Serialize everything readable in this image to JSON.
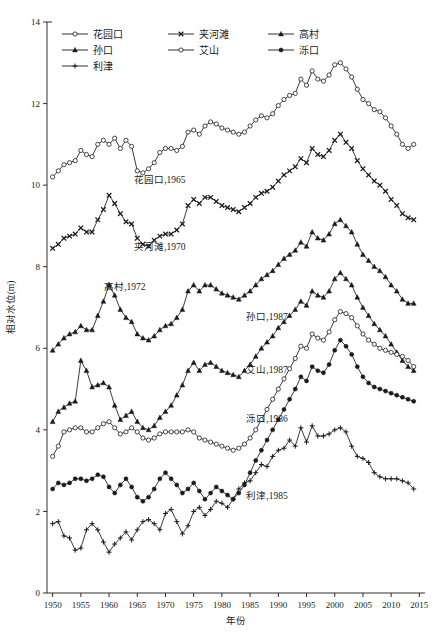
{
  "figure": {
    "width": 446,
    "height": 638,
    "background": "#ffffff",
    "line_color": "#1a1a1a"
  },
  "axes": {
    "x_title": "年份",
    "y_title": "相对水位(m)",
    "x_ticks": [
      "1950",
      "1955",
      "1960",
      "1965",
      "1970",
      "1975",
      "1980",
      "1985",
      "1990",
      "1995",
      "2000",
      "2005",
      "2010",
      "2015"
    ],
    "y_ticks": [
      "0",
      "2",
      "4",
      "6",
      "8",
      "10",
      "12",
      "14"
    ]
  },
  "legend": {
    "items": [
      {
        "label": "花园口",
        "marker": "open-circle"
      },
      {
        "label": "夹河滩",
        "marker": "x-cross"
      },
      {
        "label": "高村",
        "marker": "filled-triangle"
      },
      {
        "label": "孙口",
        "marker": "filled-triangle"
      },
      {
        "label": "艾山",
        "marker": "open-circle"
      },
      {
        "label": "泺口",
        "marker": "filled-circle"
      },
      {
        "label": "利津",
        "marker": "plus"
      }
    ]
  },
  "annotations": [
    {
      "text": "花园口,1965",
      "x": 1969.0,
      "y": 10.05
    },
    {
      "text": "夹河滩,1970",
      "x": 1969.0,
      "y": 8.42
    },
    {
      "text": "高村,1972",
      "x": 1962.8,
      "y": 7.42
    },
    {
      "text": "孙口,1987",
      "x": 1988.0,
      "y": 6.7
    },
    {
      "text": "艾山,1987",
      "x": 1988.0,
      "y": 5.4
    },
    {
      "text": "泺口,1986",
      "x": 1988.0,
      "y": 4.2
    },
    {
      "text": "利津,1985",
      "x": 1988.0,
      "y": 2.3
    }
  ],
  "chart_data": {
    "type": "line",
    "title": "",
    "subtitle": "",
    "xlabel": "年份",
    "ylabel": "相对水位(m)",
    "xlim": [
      1949,
      2016
    ],
    "ylim": [
      0,
      14
    ],
    "xticks": [
      1950,
      1955,
      1960,
      1965,
      1970,
      1975,
      1980,
      1985,
      1990,
      1995,
      2000,
      2005,
      2010,
      2015
    ],
    "yticks": [
      0,
      2,
      4,
      6,
      8,
      10,
      12,
      14
    ],
    "grid": false,
    "legend_position": "top-left-inside",
    "x": [
      1950,
      1951,
      1952,
      1953,
      1954,
      1955,
      1956,
      1957,
      1958,
      1959,
      1960,
      1961,
      1962,
      1963,
      1964,
      1965,
      1966,
      1967,
      1968,
      1969,
      1970,
      1971,
      1972,
      1973,
      1974,
      1975,
      1976,
      1977,
      1978,
      1979,
      1980,
      1981,
      1982,
      1983,
      1984,
      1985,
      1986,
      1987,
      1988,
      1989,
      1990,
      1991,
      1992,
      1993,
      1994,
      1995,
      1996,
      1997,
      1998,
      1999,
      2000,
      2001,
      2002,
      2003,
      2004,
      2005,
      2006,
      2007,
      2008,
      2009,
      2010,
      2011,
      2012,
      2013,
      2014
    ],
    "series": [
      {
        "name": "花园口",
        "marker": "open-circle",
        "annotation": "花园口,1965",
        "values": [
          10.2,
          10.35,
          10.5,
          10.55,
          10.6,
          10.85,
          10.75,
          10.7,
          11.0,
          11.1,
          11.0,
          11.15,
          10.9,
          11.1,
          10.95,
          10.35,
          10.3,
          10.4,
          10.55,
          10.8,
          10.9,
          10.9,
          10.85,
          10.95,
          11.3,
          11.35,
          11.25,
          11.45,
          11.55,
          11.5,
          11.4,
          11.35,
          11.3,
          11.25,
          11.3,
          11.45,
          11.6,
          11.7,
          11.65,
          11.75,
          11.95,
          12.1,
          12.2,
          12.25,
          12.6,
          12.45,
          12.8,
          12.6,
          12.55,
          12.7,
          12.95,
          13.0,
          12.85,
          12.65,
          12.35,
          12.1,
          12.0,
          11.85,
          11.8,
          11.65,
          11.45,
          11.25,
          11.0,
          10.9,
          11.0
        ]
      },
      {
        "name": "夹河滩",
        "marker": "x-cross",
        "annotation": "夹河滩,1970",
        "values": [
          8.45,
          8.55,
          8.7,
          8.75,
          8.8,
          8.95,
          8.85,
          8.85,
          9.15,
          9.4,
          9.75,
          9.55,
          9.3,
          9.1,
          9.05,
          8.7,
          8.55,
          8.5,
          8.65,
          8.75,
          8.8,
          8.8,
          8.9,
          9.05,
          9.5,
          9.65,
          9.55,
          9.7,
          9.7,
          9.6,
          9.5,
          9.45,
          9.4,
          9.35,
          9.45,
          9.55,
          9.7,
          9.8,
          9.85,
          9.95,
          10.1,
          10.25,
          10.35,
          10.45,
          10.65,
          10.55,
          10.9,
          10.75,
          10.7,
          10.85,
          11.1,
          11.25,
          11.05,
          10.9,
          10.6,
          10.4,
          10.25,
          10.1,
          10.0,
          9.85,
          9.65,
          9.5,
          9.3,
          9.2,
          9.15
        ]
      },
      {
        "name": "高村",
        "marker": "filled-triangle",
        "annotation": "高村,1972",
        "values": [
          5.95,
          6.1,
          6.25,
          6.35,
          6.4,
          6.55,
          6.45,
          6.45,
          6.8,
          7.15,
          7.55,
          7.3,
          6.95,
          6.75,
          6.65,
          6.35,
          6.25,
          6.2,
          6.3,
          6.45,
          6.55,
          6.6,
          6.75,
          6.95,
          7.4,
          7.55,
          7.4,
          7.55,
          7.55,
          7.45,
          7.35,
          7.3,
          7.25,
          7.2,
          7.3,
          7.4,
          7.55,
          7.7,
          7.8,
          7.9,
          8.05,
          8.2,
          8.3,
          8.4,
          8.6,
          8.5,
          8.85,
          8.7,
          8.65,
          8.8,
          9.05,
          9.15,
          9.0,
          8.85,
          8.55,
          8.3,
          8.15,
          8.0,
          7.9,
          7.75,
          7.55,
          7.4,
          7.2,
          7.1,
          7.1
        ]
      },
      {
        "name": "孙口",
        "marker": "filled-triangle",
        "annotation": "孙口,1987",
        "values": [
          4.2,
          4.45,
          4.55,
          4.65,
          4.7,
          5.7,
          5.45,
          5.05,
          5.1,
          5.15,
          5.05,
          4.6,
          4.25,
          4.35,
          4.45,
          4.2,
          4.05,
          4.0,
          4.1,
          4.3,
          4.45,
          4.6,
          4.85,
          5.1,
          5.45,
          5.65,
          5.45,
          5.6,
          5.65,
          5.55,
          5.45,
          5.4,
          5.35,
          5.3,
          5.45,
          5.6,
          5.8,
          6.0,
          6.15,
          6.3,
          6.5,
          6.65,
          6.8,
          6.95,
          7.15,
          7.05,
          7.4,
          7.3,
          7.25,
          7.4,
          7.7,
          7.85,
          7.7,
          7.55,
          7.25,
          7.0,
          6.8,
          6.6,
          6.45,
          6.3,
          6.1,
          5.9,
          5.7,
          5.55,
          5.45
        ]
      },
      {
        "name": "艾山",
        "marker": "open-circle",
        "annotation": "艾山,1987",
        "values": [
          3.35,
          3.6,
          3.95,
          4.0,
          4.05,
          4.05,
          3.95,
          3.95,
          4.05,
          4.15,
          4.2,
          4.05,
          3.9,
          3.95,
          4.05,
          3.95,
          3.8,
          3.75,
          3.8,
          3.9,
          3.95,
          3.95,
          3.95,
          3.95,
          4.0,
          3.95,
          3.8,
          3.75,
          3.7,
          3.65,
          3.6,
          3.55,
          3.5,
          3.55,
          3.65,
          3.8,
          4.0,
          4.25,
          4.5,
          4.75,
          5.0,
          5.25,
          5.5,
          5.75,
          6.05,
          6.0,
          6.35,
          6.25,
          6.2,
          6.4,
          6.7,
          6.9,
          6.85,
          6.75,
          6.55,
          6.35,
          6.2,
          6.1,
          6.0,
          5.95,
          5.9,
          5.85,
          5.8,
          5.7,
          5.55
        ]
      },
      {
        "name": "泺口",
        "marker": "filled-circle",
        "annotation": "泺口,1986",
        "values": [
          2.55,
          2.7,
          2.65,
          2.7,
          2.8,
          2.8,
          2.75,
          2.8,
          2.9,
          2.85,
          2.6,
          2.45,
          2.65,
          2.8,
          2.6,
          2.35,
          2.25,
          2.35,
          2.55,
          2.8,
          2.95,
          2.8,
          2.65,
          2.45,
          2.55,
          2.7,
          2.5,
          2.3,
          2.45,
          2.6,
          2.5,
          2.4,
          2.3,
          2.45,
          2.65,
          2.95,
          3.25,
          3.5,
          3.75,
          4.0,
          4.25,
          4.5,
          4.75,
          5.0,
          5.3,
          5.2,
          5.55,
          5.45,
          5.4,
          5.6,
          5.95,
          6.2,
          6.05,
          5.85,
          5.55,
          5.3,
          5.15,
          5.05,
          5.0,
          4.95,
          4.9,
          4.85,
          4.8,
          4.75,
          4.7
        ]
      },
      {
        "name": "利津",
        "marker": "plus",
        "annotation": "利津,1985",
        "values": [
          1.7,
          1.75,
          1.4,
          1.35,
          1.05,
          1.1,
          1.55,
          1.7,
          1.55,
          1.25,
          1.0,
          1.2,
          1.35,
          1.5,
          1.3,
          1.55,
          1.75,
          1.8,
          1.7,
          1.55,
          1.95,
          2.05,
          1.75,
          1.45,
          1.65,
          2.0,
          2.1,
          1.9,
          2.05,
          2.25,
          2.2,
          2.1,
          2.3,
          2.55,
          2.7,
          2.75,
          2.95,
          3.15,
          3.1,
          3.35,
          3.5,
          3.55,
          3.75,
          3.6,
          4.05,
          3.7,
          4.1,
          3.85,
          3.85,
          3.9,
          4.0,
          4.05,
          3.95,
          3.6,
          3.35,
          3.3,
          3.2,
          2.95,
          2.85,
          2.8,
          2.8,
          2.8,
          2.75,
          2.7,
          2.55
        ]
      }
    ]
  }
}
